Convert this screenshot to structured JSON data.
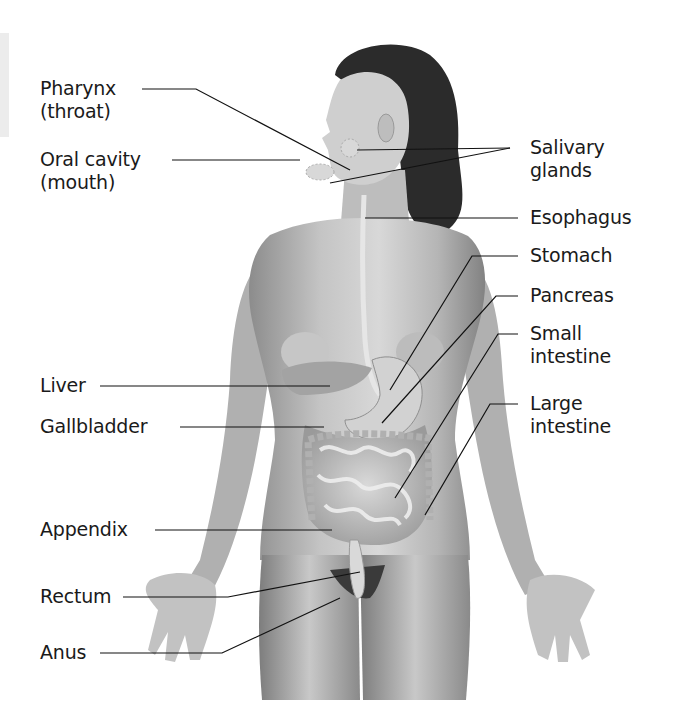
{
  "diagram": {
    "labels_left": [
      {
        "id": "pharynx",
        "line1": "Pharynx",
        "line2": "(throat)"
      },
      {
        "id": "oral-cavity",
        "line1": "Oral cavity",
        "line2": "(mouth)"
      },
      {
        "id": "liver",
        "line1": "Liver",
        "line2": ""
      },
      {
        "id": "gallbladder",
        "line1": "Gallbladder",
        "line2": ""
      },
      {
        "id": "appendix",
        "line1": "Appendix",
        "line2": ""
      },
      {
        "id": "rectum",
        "line1": "Rectum",
        "line2": ""
      },
      {
        "id": "anus",
        "line1": "Anus",
        "line2": ""
      }
    ],
    "labels_right": [
      {
        "id": "salivary-glands",
        "line1": "Salivary",
        "line2": "glands"
      },
      {
        "id": "esophagus",
        "line1": "Esophagus",
        "line2": ""
      },
      {
        "id": "stomach",
        "line1": "Stomach",
        "line2": ""
      },
      {
        "id": "pancreas",
        "line1": "Pancreas",
        "line2": ""
      },
      {
        "id": "small-intestine",
        "line1": "Small",
        "line2": "intestine"
      },
      {
        "id": "large-intestine",
        "line1": "Large",
        "line2": "intestine"
      }
    ],
    "colors": {
      "text": "#1a1a1a",
      "leader_line": "#111111",
      "skin_light": "#d6d6d6",
      "skin_mid": "#a9a9a9",
      "skin_dark": "#7a7a7a",
      "hair": "#2b2b2b",
      "organs": "#c9c9c9"
    }
  }
}
